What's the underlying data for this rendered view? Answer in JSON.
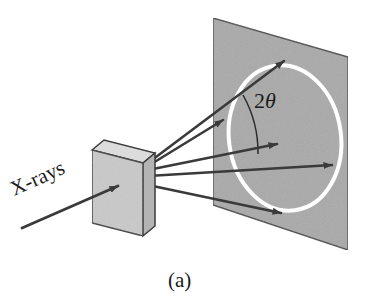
{
  "figure": {
    "caption": "(a)",
    "background_color": "#ffffff"
  },
  "labels": {
    "source_label": "X-rays",
    "angle_label_number": "2",
    "angle_label_symbol": "θ",
    "angle_label_full": "2θ"
  },
  "colors": {
    "screen_fill": "#a9a9a9",
    "screen_edge": "#4a4a4a",
    "ring_stroke": "#ffffff",
    "sample_front": "#c9c9c9",
    "sample_side": "#b4b4b4",
    "sample_top": "#dcdcdc",
    "sample_edge": "#3a3a3a",
    "ray_stroke": "#3a3a3a",
    "arc_stroke": "#2a2a2a",
    "text": "#1a1a1a"
  },
  "detector_screen": {
    "name": "detector-screen",
    "shape": "parallelogram",
    "corners": [
      {
        "x": 213,
        "y": 18
      },
      {
        "x": 348,
        "y": 57
      },
      {
        "x": 348,
        "y": 250
      },
      {
        "x": 213,
        "y": 205
      }
    ]
  },
  "diffraction_ring": {
    "name": "diffraction-ring",
    "shape": "ellipse",
    "center": {
      "x": 285,
      "y": 138
    },
    "radius_x": 56,
    "radius_y": 73,
    "rotation_deg": -8,
    "stroke_width": 4
  },
  "sample": {
    "name": "specimen-slab",
    "front_face": [
      {
        "x": 92,
        "y": 150
      },
      {
        "x": 143,
        "y": 163
      },
      {
        "x": 143,
        "y": 236
      },
      {
        "x": 92,
        "y": 223
      }
    ],
    "side_face": [
      {
        "x": 143,
        "y": 163
      },
      {
        "x": 155,
        "y": 153
      },
      {
        "x": 155,
        "y": 226
      },
      {
        "x": 143,
        "y": 236
      }
    ],
    "top_face": [
      {
        "x": 92,
        "y": 150
      },
      {
        "x": 104,
        "y": 140
      },
      {
        "x": 155,
        "y": 153
      },
      {
        "x": 143,
        "y": 163
      }
    ]
  },
  "incident_beam": {
    "name": "incident-xray-beam",
    "from": {
      "x": 22,
      "y": 228
    },
    "to": {
      "x": 118,
      "y": 186
    }
  },
  "diffracted_rays": [
    {
      "name": "diffracted-ray-upper-outer",
      "from": {
        "x": 148,
        "y": 163
      },
      "to": {
        "x": 284,
        "y": 61
      }
    },
    {
      "name": "diffracted-ray-upper-inner",
      "from": {
        "x": 148,
        "y": 166
      },
      "to": {
        "x": 223,
        "y": 120
      }
    },
    {
      "name": "diffracted-ray-middle-upper",
      "from": {
        "x": 148,
        "y": 170
      },
      "to": {
        "x": 277,
        "y": 144
      }
    },
    {
      "name": "diffracted-ray-central",
      "from": {
        "x": 148,
        "y": 176
      },
      "to": {
        "x": 332,
        "y": 165
      }
    },
    {
      "name": "diffracted-ray-lower",
      "from": {
        "x": 148,
        "y": 185
      },
      "to": {
        "x": 281,
        "y": 213
      }
    }
  ],
  "angle_arc": {
    "name": "two-theta-angle-arc",
    "vertex": {
      "x": 148,
      "y": 163
    },
    "start": {
      "x": 243,
      "y": 95
    },
    "end": {
      "x": 258,
      "y": 154
    },
    "radius": 117
  },
  "label_positions": {
    "source_label": {
      "x": 14,
      "y": 196,
      "rotation_deg": -24
    },
    "angle_label": {
      "x": 254,
      "y": 108
    },
    "caption": {
      "x": 168,
      "y": 287
    }
  }
}
